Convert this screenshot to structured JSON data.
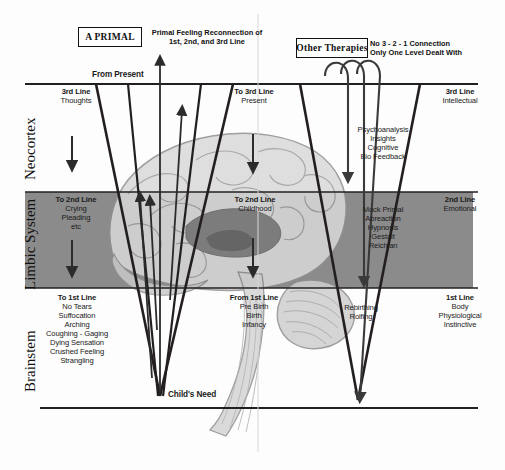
{
  "diagram": {
    "title_left_tag": "A PRIMAL",
    "title_left_caption_line1": "Primal Feeling Reconnection of",
    "title_left_caption_line2": "1st, 2nd, and 3rd Line",
    "title_right_tag": "Other Therapies",
    "title_right_caption_line1": "No 3 - 2 - 1 Connection",
    "title_right_caption_line2": "Only One Level Dealt With",
    "from_present": "From Present",
    "childs_need": "Child's Need"
  },
  "brain_levels": [
    {
      "name": "Neocortex"
    },
    {
      "name": "Limbic System"
    },
    {
      "name": "Brainstem"
    }
  ],
  "left_column": [
    {
      "heading": "3rd Line",
      "items": [
        "Thoughts"
      ]
    },
    {
      "heading": "To 2nd Line",
      "items": [
        "Crying",
        "Pleading",
        "etc"
      ]
    },
    {
      "heading": "To 1st Line",
      "items": [
        "No Tears",
        "Suffocation",
        "Arching",
        "Coughing - Gaging",
        "Dying Sensation",
        "Crushed Feeling",
        "Strangling"
      ]
    }
  ],
  "middle_column": [
    {
      "heading": "To 3rd Line",
      "items": [
        "Present"
      ]
    },
    {
      "heading": "To 2nd Line",
      "items": [
        "Childhood"
      ]
    },
    {
      "heading": "From 1st Line",
      "items": [
        "Pre Birth",
        "Birth",
        "Infancy"
      ]
    }
  ],
  "therapy_column": [
    {
      "items": [
        "Psychoanalysis",
        "Insights",
        "Cognitive",
        "Bio Feedback"
      ]
    },
    {
      "items": [
        "Mock Primal",
        "Abreaction",
        "Hypnosis",
        "Gestalt",
        "Reichian"
      ]
    },
    {
      "items": [
        "Rebirthing",
        "Rolfing"
      ]
    }
  ],
  "right_column": [
    {
      "heading": "3rd Line",
      "items": [
        "Intellectual"
      ]
    },
    {
      "heading": "2nd Line",
      "items": [
        "Emotional"
      ]
    },
    {
      "heading": "1st Line",
      "items": [
        "Body",
        "Physiological",
        "Instinctive"
      ]
    }
  ],
  "colors": {
    "band": "#8b8b8b",
    "line": "#231f20",
    "brain_light": "#d2d2d2",
    "brain_mid": "#a8a8a8",
    "brain_dark": "#6f6f6f"
  }
}
